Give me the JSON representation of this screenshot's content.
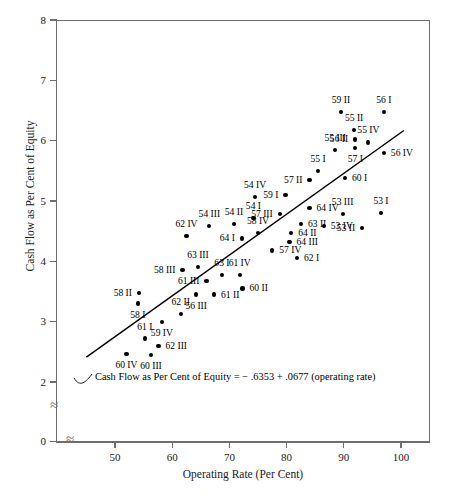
{
  "chart_data": {
    "type": "scatter",
    "title": "",
    "xlabel": "Operating Rate (Per Cent)",
    "ylabel": "Cash Flow as Per Cent of Equity",
    "xlim": [
      43,
      105
    ],
    "ylim": [
      0,
      8
    ],
    "y_break_below": 2,
    "x_break_after_axis_origin": true,
    "grid": false,
    "legend": null,
    "xticks": [
      50,
      60,
      70,
      80,
      90,
      100
    ],
    "yticks": [
      0,
      2,
      3,
      4,
      5,
      6,
      7,
      8
    ],
    "annotation": "Cash Flow as Per Cent of Equity = − .6353 + .0677 (operating rate)",
    "fit_line": {
      "intercept": -0.6353,
      "slope": 0.0677,
      "x_start": 45.0,
      "x_end": 100.5
    },
    "points": [
      {
        "label": "60 IV",
        "x": 52.0,
        "y": 2.47,
        "lp": "bot"
      },
      {
        "label": "61 I",
        "x": 55.2,
        "y": 2.72,
        "lp": "top"
      },
      {
        "label": "62 III",
        "x": 57.6,
        "y": 2.6,
        "lp": "rgt"
      },
      {
        "label": "60 III",
        "x": 56.3,
        "y": 2.45,
        "lp": "bot"
      },
      {
        "label": "59 IV",
        "x": 58.2,
        "y": 3.0,
        "lp": "bot"
      },
      {
        "label": "58 I",
        "x": 54.0,
        "y": 3.3,
        "lp": "bot"
      },
      {
        "label": "58 II",
        "x": 54.2,
        "y": 3.47,
        "lp": "lft"
      },
      {
        "label": "62 II",
        "x": 61.5,
        "y": 3.13,
        "lp": "top"
      },
      {
        "label": "56 III",
        "x": 64.2,
        "y": 3.45,
        "lp": "bot"
      },
      {
        "label": "61 II",
        "x": 67.3,
        "y": 3.45,
        "lp": "rgt"
      },
      {
        "label": "58 III",
        "x": 61.8,
        "y": 3.85,
        "lp": "lft"
      },
      {
        "label": "63 III",
        "x": 64.5,
        "y": 3.9,
        "lp": "top"
      },
      {
        "label": "61 III",
        "x": 66.0,
        "y": 3.67,
        "lp": "lft"
      },
      {
        "label": "63 I",
        "x": 68.7,
        "y": 3.78,
        "lp": "top"
      },
      {
        "label": "61 IV",
        "x": 71.8,
        "y": 3.78,
        "lp": "top"
      },
      {
        "label": "60 II",
        "x": 72.3,
        "y": 3.55,
        "lp": "rgt"
      },
      {
        "label": "62 IV",
        "x": 62.5,
        "y": 4.42,
        "lp": "top"
      },
      {
        "label": "54 III",
        "x": 66.5,
        "y": 4.58,
        "lp": "top"
      },
      {
        "label": "54 II",
        "x": 70.8,
        "y": 4.62,
        "lp": "top"
      },
      {
        "label": "64 I",
        "x": 72.2,
        "y": 4.38,
        "lp": "lft"
      },
      {
        "label": "54 I",
        "x": 74.2,
        "y": 4.72,
        "lp": "top"
      },
      {
        "label": "58 IV",
        "x": 75.0,
        "y": 4.47,
        "lp": "top"
      },
      {
        "label": "57 IV",
        "x": 77.5,
        "y": 4.18,
        "lp": "rgt"
      },
      {
        "label": "64 III",
        "x": 80.5,
        "y": 4.32,
        "lp": "rgt"
      },
      {
        "label": "64 II",
        "x": 80.8,
        "y": 4.47,
        "lp": "rgt"
      },
      {
        "label": "62 I",
        "x": 81.8,
        "y": 4.05,
        "lp": "rgt"
      },
      {
        "label": "57 III",
        "x": 78.8,
        "y": 4.78,
        "lp": "lft"
      },
      {
        "label": "54 IV",
        "x": 74.5,
        "y": 5.07,
        "lp": "top"
      },
      {
        "label": "59 I",
        "x": 79.8,
        "y": 5.1,
        "lp": "lft"
      },
      {
        "label": "63 II",
        "x": 82.5,
        "y": 4.62,
        "lp": "rgt"
      },
      {
        "label": "64 IV",
        "x": 84.0,
        "y": 4.88,
        "lp": "rgt"
      },
      {
        "label": "53 IV",
        "x": 86.5,
        "y": 4.58,
        "lp": "rgt"
      },
      {
        "label": "53 III",
        "x": 89.8,
        "y": 4.78,
        "lp": "top"
      },
      {
        "label": "53 II",
        "x": 93.2,
        "y": 4.55,
        "lp": "lft"
      },
      {
        "label": "53 I",
        "x": 96.5,
        "y": 4.8,
        "lp": "top"
      },
      {
        "label": "57 II",
        "x": 84.0,
        "y": 5.35,
        "lp": "lft"
      },
      {
        "label": "55 I",
        "x": 85.5,
        "y": 5.5,
        "lp": "top"
      },
      {
        "label": "60 I",
        "x": 90.2,
        "y": 5.38,
        "lp": "rgt"
      },
      {
        "label": "55 III",
        "x": 88.5,
        "y": 5.85,
        "lp": "top"
      },
      {
        "label": "57 I",
        "x": 92.0,
        "y": 5.88,
        "lp": "bot"
      },
      {
        "label": "56 II",
        "x": 92.0,
        "y": 6.02,
        "lp": "lft"
      },
      {
        "label": "55 II",
        "x": 91.8,
        "y": 6.18,
        "lp": "top"
      },
      {
        "label": "55 IV",
        "x": 94.3,
        "y": 5.97,
        "lp": "top"
      },
      {
        "label": "56 IV",
        "x": 97.0,
        "y": 5.8,
        "lp": "rgt"
      },
      {
        "label": "59 II",
        "x": 89.5,
        "y": 6.48,
        "lp": "top"
      },
      {
        "label": "56 I",
        "x": 97.0,
        "y": 6.48,
        "lp": "top"
      }
    ]
  }
}
